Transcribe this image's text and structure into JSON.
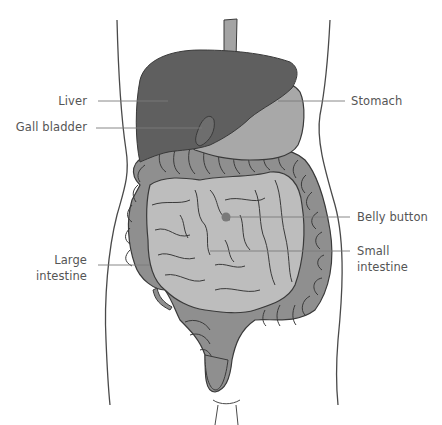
{
  "diagram": {
    "type": "anatomical-illustration",
    "colors": {
      "liver": "#5f5f5f",
      "stomach": "#a8a8a8",
      "esophagus": "#a4a4a4",
      "small_intestine": "#bdbdbd",
      "large_intestine": "#8f8f8f",
      "outline": "#3a3a3a",
      "body_outline": "#4a4a4a",
      "leader_line": "#7a7a7a",
      "label_text": "#555555",
      "belly_button": "#7a7a7a"
    }
  },
  "labels": {
    "liver": "Liver",
    "gall_bladder": "Gall bladder",
    "stomach": "Stomach",
    "belly_button": "Belly button",
    "small_intestine_line1": "Small",
    "small_intestine_line2": "intestine",
    "large_intestine_line1": "Large",
    "large_intestine_line2": "intestine"
  }
}
